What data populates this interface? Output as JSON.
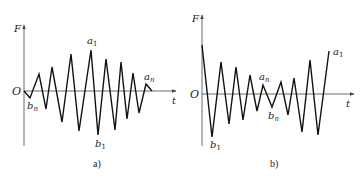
{
  "panels": [
    {
      "id": "a",
      "caption": "a)",
      "y_axis_label": "F",
      "x_axis_label": "t",
      "origin_label": "O",
      "point_labels": {
        "a1": {
          "base": "a",
          "sub": "1"
        },
        "b1": {
          "base": "b",
          "sub": "1"
        },
        "an": {
          "base": "a",
          "sub": "n"
        },
        "bn": {
          "base": "b",
          "sub": "n"
        }
      },
      "description": "Load sequence with amplitude increasing from b_n to a_1/b_1 then decreasing to a_n (low-high-low)",
      "polyline": [
        [
          24,
          91
        ],
        [
          30,
          98
        ],
        [
          39,
          74
        ],
        [
          46,
          109
        ],
        [
          52,
          67
        ],
        [
          62,
          122
        ],
        [
          71,
          54
        ],
        [
          79,
          131
        ],
        [
          91,
          50
        ],
        [
          98,
          135
        ],
        [
          106,
          59
        ],
        [
          115,
          130
        ],
        [
          121,
          62
        ],
        [
          127,
          119
        ],
        [
          133,
          73
        ],
        [
          139,
          113
        ],
        [
          146,
          84
        ],
        [
          152,
          91
        ]
      ]
    },
    {
      "id": "b",
      "caption": "b)",
      "y_axis_label": "F",
      "x_axis_label": "t",
      "origin_label": "O",
      "point_labels": {
        "a1": {
          "base": "a",
          "sub": "1"
        },
        "b1": {
          "base": "b",
          "sub": "1"
        },
        "an": {
          "base": "a",
          "sub": "n"
        },
        "bn": {
          "base": "b",
          "sub": "n"
        }
      },
      "description": "Load sequence with amplitude decreasing from b_1 to a_n/b_n then increasing to a_1 (high-low-high)",
      "polyline": [
        [
          202,
          45
        ],
        [
          212,
          137
        ],
        [
          221,
          62
        ],
        [
          229,
          124
        ],
        [
          236,
          67
        ],
        [
          243,
          120
        ],
        [
          250,
          75
        ],
        [
          257,
          111
        ],
        [
          263,
          85
        ],
        [
          272,
          107
        ],
        [
          281,
          82
        ],
        [
          288,
          115
        ],
        [
          294,
          78
        ],
        [
          302,
          132
        ],
        [
          310,
          60
        ],
        [
          318,
          135
        ],
        [
          329,
          51
        ]
      ]
    }
  ]
}
